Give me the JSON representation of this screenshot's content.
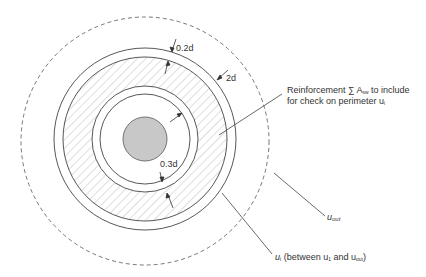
{
  "diagram": {
    "type": "punching shear perimeters around column",
    "center": {
      "x": 145,
      "y": 139
    },
    "column": {
      "radius": 22,
      "fill": "#c8c8c8"
    },
    "rings": {
      "outer_solid_r": 91,
      "second_r": 82,
      "third_r": 53,
      "inner_r": 45,
      "dashed_r": 124
    },
    "labels": {
      "dim_02d": "0.2d",
      "dim_2d": "2d",
      "dim_03d": "0.3d",
      "reinforcement_line1": "Reinforcement ∑ A",
      "reinforcement_sub": "sw",
      "reinforcement_tail": " to include",
      "reinforcement_line2": "for check on perimeter u",
      "reinforcement_line2_sub": "i",
      "u_out": "u",
      "u_out_sub": "out",
      "u_i": "u",
      "u_i_sub": "i",
      "u_i_paren_a": " (between u",
      "u_i_paren_sub1": "1",
      "u_i_paren_b": " and u",
      "u_i_paren_sub2": "out",
      "u_i_paren_c": ")"
    },
    "colors": {
      "line": "#444444",
      "hatch": "#9a9a9a",
      "dashed": "#666666",
      "text": "#333333"
    }
  }
}
